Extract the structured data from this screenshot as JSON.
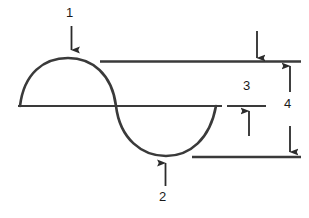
{
  "diagram": {
    "type": "sine-wave-annotated",
    "background_color": "#ffffff",
    "line_color": "#333333",
    "label_color": "#1a1a1a",
    "callouts": [
      {
        "id": "1",
        "label": "1",
        "marker": "arrow-down",
        "points_to": "wave-crest",
        "description": "crest of the wave"
      },
      {
        "id": "2",
        "label": "2",
        "marker": "arrow-up",
        "points_to": "wave-trough",
        "description": "trough of the wave"
      },
      {
        "id": "3",
        "label": "3",
        "marker": "arrow-down-and-arrow-up",
        "points_to": "amplitude-span",
        "description": "amplitude from crest level to rest level"
      },
      {
        "id": "4",
        "label": "4",
        "marker": "double-headed-arrow",
        "points_to": "peak-to-peak-span",
        "description": "peak to peak amplitude from crest level to trough level"
      }
    ],
    "reference_lines": [
      {
        "name": "crest-level-line",
        "y": 62,
        "x1": 100,
        "x2": 301
      },
      {
        "name": "rest-level-line",
        "y": 106,
        "x1": 18,
        "x2": 222
      },
      {
        "name": "rest-level-tick",
        "y": 106,
        "x1": 227,
        "x2": 266
      },
      {
        "name": "trough-level-line",
        "y": 157,
        "x1": 192,
        "x2": 301
      }
    ],
    "wave": {
      "baseline_y": 106,
      "start_x": 20,
      "end_x": 216,
      "crest_y": 62,
      "crest_x": 68,
      "trough_y": 155,
      "trough_x": 166,
      "zero_crossing_x": 116,
      "cycles": 1
    }
  }
}
